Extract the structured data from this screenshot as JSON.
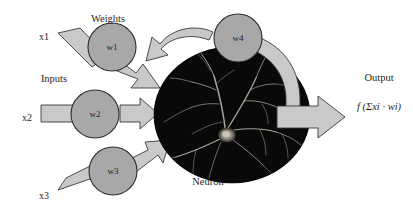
{
  "diagram": {
    "title_labels": {
      "weights": "Weights",
      "inputs": "Inputs",
      "neuron": "Neuron",
      "output": "Output"
    },
    "inputs": [
      {
        "id": "x1",
        "label": "x1"
      },
      {
        "id": "x2",
        "label": "x2"
      },
      {
        "id": "x3",
        "label": "x3"
      }
    ],
    "weights": [
      {
        "id": "w1",
        "label": "w1"
      },
      {
        "id": "w2",
        "label": "w2"
      },
      {
        "id": "w3",
        "label": "w3"
      },
      {
        "id": "w4",
        "label": "w4"
      }
    ],
    "output": {
      "label": "Output",
      "formula": "f (Σxi · wi)"
    },
    "colors": {
      "arrow_fill": "#c9c9c9",
      "arrow_stroke": "#3a3a3a",
      "node_fill": "#a8a8a8",
      "node_stroke": "#2e2e2e",
      "neuron_body": "#000000",
      "dendrite": "#b9b2a6",
      "background": "#ffffff",
      "text": "#1f1f1f"
    }
  }
}
